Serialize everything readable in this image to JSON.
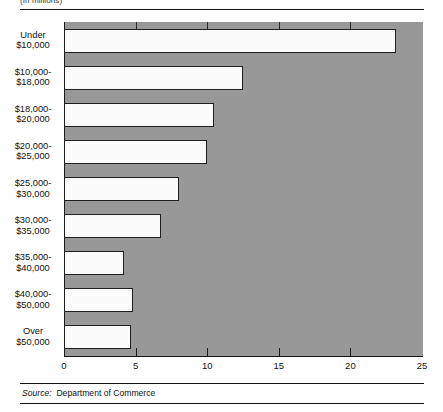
{
  "header": {
    "unit_note": "(In millions)"
  },
  "footer": {
    "source_label": "Source:",
    "source_value": "Department of Commerce"
  },
  "colors": {
    "plot_background": "#989898",
    "bar_fill": "#fbfbfb",
    "bar_stroke": "#1f1f1f",
    "axis": "#111111",
    "page_background": "#ffffff"
  },
  "chart_data": {
    "type": "bar",
    "orientation": "horizontal",
    "title": "",
    "subtitle": "",
    "xlabel": "",
    "ylabel": "",
    "unit_note": "(In millions)",
    "xlim": [
      0,
      25
    ],
    "xticks": [
      0,
      5,
      10,
      15,
      20,
      25
    ],
    "xtick_labels": [
      "0",
      "5",
      "10",
      "15",
      "20",
      "25"
    ],
    "grid": false,
    "legend": null,
    "categories": [
      "Under\n$10,000",
      "$10,000-\n$18,000",
      "$18,000-\n$20,000",
      "$20,000-\n$25,000",
      "$25,000-\n$30,000",
      "$30,000-\n$35,000",
      "$35,000-\n$40,000",
      "$40,000-\n$50,000",
      "Over\n$50,000"
    ],
    "category_lines": [
      [
        "Under",
        "$10,000"
      ],
      [
        "$10,000-",
        "$18,000"
      ],
      [
        "$18,000-",
        "$20,000"
      ],
      [
        "$20,000-",
        "$25,000"
      ],
      [
        "$25,000-",
        "$30,000"
      ],
      [
        "$30,000-",
        "$35,000"
      ],
      [
        "$35,000-",
        "$40,000"
      ],
      [
        "$40,000-",
        "$50,000"
      ],
      [
        "Over",
        "$50,000"
      ]
    ],
    "values": [
      23.2,
      12.5,
      10.5,
      10.0,
      8.0,
      6.8,
      4.2,
      4.8,
      4.7
    ],
    "source": "Department of Commerce"
  }
}
